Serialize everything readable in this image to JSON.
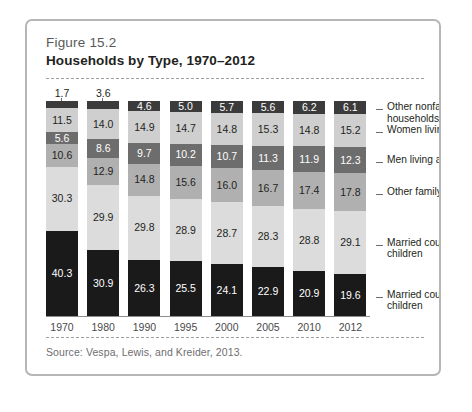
{
  "figure": {
    "number": "Figure 15.2",
    "title": "Households by Type, 1970–2012",
    "source": "Source: Vespa, Lewis, and Kreider, 2013."
  },
  "chart_data": {
    "type": "bar",
    "stacked": true,
    "stack_mode": "percent",
    "title": "Households by Type, 1970–2012",
    "subtitle": "Figure 15.2",
    "xlabel": "",
    "ylabel": "",
    "ylim": [
      0,
      100
    ],
    "grid": false,
    "legend_position": "right",
    "note": "Source: Vespa, Lewis, and Kreider, 2013.",
    "categories": [
      "1970",
      "1980",
      "1990",
      "1995",
      "2000",
      "2005",
      "2010",
      "2012"
    ],
    "series": [
      {
        "name": "Married couples with children",
        "color": "#1a1a1a",
        "label_color": "#ffffff",
        "values": [
          40.3,
          30.9,
          26.3,
          25.5,
          24.1,
          22.9,
          20.9,
          19.6
        ]
      },
      {
        "name": "Married couples without children",
        "color": "#dcdcdc",
        "label_color": "#231f20",
        "values": [
          30.3,
          29.9,
          29.8,
          28.9,
          28.7,
          28.3,
          28.8,
          29.1
        ]
      },
      {
        "name": "Other family households",
        "color": "#b0b0b0",
        "label_color": "#231f20",
        "values": [
          10.6,
          12.9,
          14.8,
          15.6,
          16.0,
          16.7,
          17.4,
          17.8
        ]
      },
      {
        "name": "Men living alone",
        "color": "#6d6d6d",
        "label_color": "#ffffff",
        "values": [
          5.6,
          8.6,
          9.7,
          10.2,
          10.7,
          11.3,
          11.9,
          12.3
        ]
      },
      {
        "name": "Women living alone",
        "color": "#cfcfcf",
        "label_color": "#231f20",
        "values": [
          11.5,
          14.0,
          14.9,
          14.7,
          14.8,
          15.3,
          14.8,
          15.2
        ]
      },
      {
        "name": "Other nonfamily households",
        "color": "#3b3b3b",
        "label_color": "#ffffff",
        "values": [
          1.7,
          3.6,
          4.6,
          5.0,
          5.7,
          5.6,
          6.2,
          6.1
        ]
      }
    ],
    "legend_entries": [
      "Other nonfamily households",
      "Women living alone",
      "Men living alone",
      "Other family households",
      "Married couples without children",
      "Married couples with children"
    ]
  }
}
